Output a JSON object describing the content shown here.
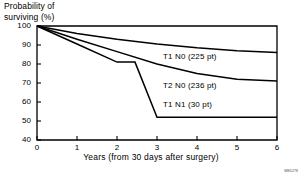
{
  "chart_data": {
    "type": "line",
    "title": "",
    "ylabel": "Probability of\nsurviving (%)",
    "xlabel": "Years (from 30 days after surgery)",
    "xlim": [
      0,
      6
    ],
    "ylim": [
      40,
      100
    ],
    "xticks": [
      "0",
      "1",
      "2",
      "3",
      "4",
      "5",
      "6"
    ],
    "yticks": [
      "100",
      "90",
      "80",
      "70",
      "60",
      "50",
      "40"
    ],
    "grid": false,
    "legend_position": "inline-right",
    "series": [
      {
        "name": "T1 N0",
        "label": "T1 N0  (225 pt)",
        "count": 225,
        "stage": "T1 N0",
        "label_x": 3.15,
        "label_y": 83.5,
        "x": [
          0,
          1,
          2,
          3,
          4,
          5,
          6
        ],
        "y": [
          100,
          96,
          93,
          90.5,
          88.5,
          87,
          86
        ]
      },
      {
        "name": "T2 N0",
        "label": "T2 N0  (236 pt)",
        "count": 236,
        "stage": "T2 N0",
        "label_x": 3.15,
        "label_y": 68.5,
        "x": [
          0,
          1,
          2,
          3,
          4,
          5,
          6
        ],
        "y": [
          100,
          93,
          86.5,
          80,
          75,
          72,
          71
        ]
      },
      {
        "name": "T1 N1",
        "label": "T1 N1  (30 pt)",
        "count": 30,
        "stage": "T1 N1",
        "label_x": 3.15,
        "label_y": 58.5,
        "x": [
          0,
          1,
          2,
          2.45,
          3,
          4,
          5,
          6
        ],
        "y": [
          100,
          90.5,
          81,
          81,
          52,
          52,
          52,
          52
        ]
      }
    ]
  },
  "figure": {
    "corner_id": "MED278"
  }
}
